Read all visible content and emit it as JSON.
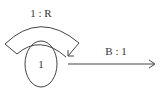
{
  "diagram": {
    "type": "state-transition",
    "states": [
      {
        "id": "state-1",
        "label": "1",
        "cx": 41,
        "cy": 64,
        "rx": 16,
        "ry": 23
      }
    ],
    "transitions": [
      {
        "id": "self-loop",
        "from": "1",
        "to": "1",
        "label": "1 : R"
      },
      {
        "id": "exit",
        "from": "1",
        "to": null,
        "label": "B : 1"
      }
    ]
  },
  "colors": {
    "line": "#444444",
    "text": "#333333",
    "background": "#ffffff"
  }
}
